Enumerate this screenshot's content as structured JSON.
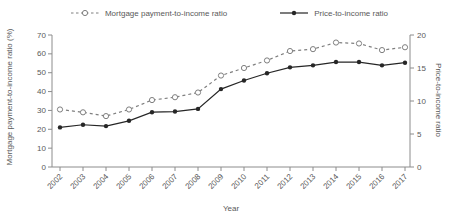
{
  "figure": {
    "background": "#ffffff",
    "text_color": "#595959",
    "axis_color": "#8c8c8c"
  },
  "chart_data": {
    "type": "line",
    "title": "",
    "xlabel": "Year",
    "categories": [
      "2002",
      "2003",
      "2004",
      "2005",
      "2006",
      "2007",
      "2008",
      "2009",
      "2010",
      "2011",
      "2012",
      "2013",
      "2014",
      "2015",
      "2016",
      "2017"
    ],
    "series": [
      {
        "name": "Mortgage payment-to-income ratio",
        "axis": "left",
        "line_style": "dashed",
        "marker": "open-circle",
        "color": "#7f7f7f",
        "values": [
          30.5,
          29,
          27,
          30.5,
          35.5,
          37,
          39.5,
          48.5,
          52.5,
          56.5,
          61.5,
          62.5,
          66,
          65.5,
          62,
          63.5
        ]
      },
      {
        "name": "Price-to-income ratio",
        "axis": "right",
        "line_style": "solid",
        "marker": "filled-circle",
        "color": "#262626",
        "values": [
          6.0,
          6.4,
          6.2,
          7.0,
          8.3,
          8.4,
          8.8,
          11.8,
          13.1,
          14.2,
          15.1,
          15.4,
          15.9,
          15.9,
          15.4,
          15.8
        ]
      }
    ],
    "left_axis": {
      "label": "Mortgage payment-to-income ratio (%)",
      "min": 0,
      "max": 70,
      "ticks": [
        0,
        10,
        20,
        30,
        40,
        50,
        60,
        70
      ]
    },
    "right_axis": {
      "label": "Price-to-income ratio",
      "min": 0,
      "max": 20,
      "ticks": [
        0,
        5,
        10,
        15,
        20
      ]
    },
    "grid": false,
    "legend_position": "top-center"
  }
}
